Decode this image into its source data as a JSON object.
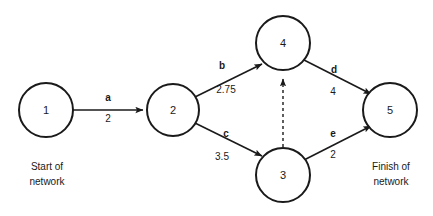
{
  "diagram": {
    "type": "activity-on-arrow network diagram",
    "background_color": "#ffffff",
    "line_color": "#1a1a1a",
    "nodes": [
      {
        "id": "1",
        "label": "1",
        "cx": 46,
        "cy": 110,
        "r": 27
      },
      {
        "id": "2",
        "label": "2",
        "cx": 173,
        "cy": 110,
        "r": 26
      },
      {
        "id": "4",
        "label": "4",
        "cx": 283,
        "cy": 43,
        "r": 27
      },
      {
        "id": "3",
        "label": "3",
        "cx": 283,
        "cy": 175,
        "r": 27
      },
      {
        "id": "5",
        "label": "5",
        "cx": 390,
        "cy": 110,
        "r": 27
      }
    ],
    "edges": [
      {
        "id": "a",
        "from": "1",
        "to": "2",
        "name": "a",
        "weight": "2",
        "style": "solid",
        "name_x": 108,
        "name_y": 101,
        "weight_x": 108,
        "weight_y": 122
      },
      {
        "id": "b",
        "from": "2",
        "to": "4",
        "name": "b",
        "weight": "2.75",
        "style": "solid",
        "name_x": 222,
        "name_y": 69,
        "weight_x": 226,
        "weight_y": 93
      },
      {
        "id": "c",
        "from": "2",
        "to": "3",
        "name": "c",
        "weight": "3.5",
        "style": "solid",
        "name_x": 226,
        "name_y": 137,
        "weight_x": 222,
        "weight_y": 160
      },
      {
        "id": "d",
        "from": "4",
        "to": "5",
        "name": "d",
        "weight": "4",
        "style": "solid",
        "name_x": 334,
        "name_y": 73,
        "weight_x": 333,
        "weight_y": 95
      },
      {
        "id": "e",
        "from": "3",
        "to": "5",
        "name": "e",
        "weight": "2",
        "style": "solid",
        "name_x": 333,
        "name_y": 137,
        "weight_x": 333,
        "weight_y": 158
      },
      {
        "id": "dummy",
        "from": "3",
        "to": "4",
        "name": "",
        "weight": "",
        "style": "dashed",
        "name_x": 0,
        "name_y": 0,
        "weight_x": 0,
        "weight_y": 0
      }
    ],
    "captions": [
      {
        "id": "start",
        "line1": "Start of",
        "line2": "network",
        "x": 47,
        "y": 170
      },
      {
        "id": "finish",
        "line1": "Finish of",
        "line2": "network",
        "x": 391,
        "y": 170
      }
    ]
  }
}
